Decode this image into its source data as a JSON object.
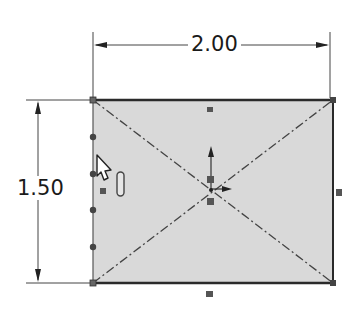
{
  "sketch": {
    "rectangle": {
      "x": 93,
      "y": 100,
      "width": 240,
      "height": 183,
      "fill": "#d8d8d8",
      "stroke": "#333333"
    },
    "dimensions": {
      "width_label": "2.00",
      "height_label": "1.50"
    },
    "construction_lines": "diagonals",
    "origin": {
      "x": 211,
      "y": 189
    },
    "relation_markers": [
      "top-midpoint",
      "right-midpoint",
      "bottom-midpoint",
      "left-vertical",
      "origin"
    ],
    "cursor": "arrow-select-pointer"
  },
  "colors": {
    "line": "#333333",
    "fill": "#d9d9d9",
    "marker": "#555555",
    "background": "#ffffff"
  }
}
